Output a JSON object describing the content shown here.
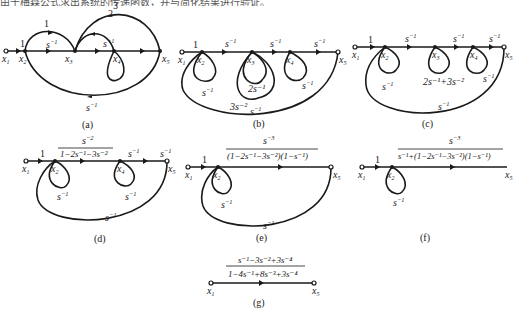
{
  "header_text": "由于梅森公式求出系统的传递函数，并与简化结果进行验证。",
  "diagrams": {
    "a": {
      "caption": "(a)",
      "nodes": [
        "x1",
        "x2",
        "x3",
        "x4",
        "x5"
      ],
      "gains": {
        "x1_x2": "1",
        "x2_x3_upper": "1",
        "x2_x3": "s^-1",
        "x3_x5_outer": "3",
        "x3_x5_inner": "2",
        "x3_x4": "s^-1",
        "x5_x2_feedback": "s^-1"
      }
    },
    "b": {
      "caption": "(b)",
      "gains": {
        "x1_x2": "1",
        "x2_x3": "s^-1",
        "x3_x4": "s^-1",
        "x4_x5": "s^-1",
        "x2_self": "s^-1",
        "x3_self_inner": "2s^-1",
        "x3_self_outer": "3s^-2",
        "x4_self": "s^-1",
        "x5_x2_feedback": "s^-1"
      }
    },
    "c": {
      "caption": "(c)",
      "gains": {
        "x1_x2": "1",
        "x2_x3": "s^-1",
        "x3_x4": "s^-1",
        "x4_x5": "s^-1",
        "x2_self": "s^-1",
        "x3_self": "2s^-1+3s^-2",
        "x4_self": "s^-1",
        "x5_x2_feedback": "s^-1"
      }
    },
    "d": {
      "caption": "(d)",
      "gains": {
        "x1_x2": "1",
        "x2_x4": "s^-2 / (1-2s^-1-3s^-2)",
        "x4_x5": "s^-1",
        "x2_self": "s^-1",
        "x4_self": "s^-1",
        "x5_x2_feedback": "s^-1"
      }
    },
    "e": {
      "caption": "(e)",
      "gains": {
        "x1_x2": "1",
        "x2_x5": "s^-3 / ((1-2s^-1-3s^-2)(1-s^-1))",
        "x2_self": "s^-1",
        "x5_x2_feedback": "s^-1"
      }
    },
    "f": {
      "caption": "(f)",
      "gains": {
        "x1_x2": "1",
        "x2_x5": "s^-3 / (s^-1+(1-2s^-1-3s^-2)(1-s^-1))",
        "x2_self": "s^-1"
      }
    },
    "g": {
      "caption": "(g)",
      "gains": {
        "x1_x5": "(s^-1-3s^-2+3s^-4) / (1-4s^-1+8s^-3+3s^-4)"
      }
    }
  },
  "labels": {
    "one": "1",
    "two": "2",
    "three": "3",
    "s": "s",
    "m1": "−1",
    "m2": "−2",
    "m3": "−3",
    "m4": "−4",
    "x": "x",
    "i1": "1",
    "i2": "2",
    "i3": "3",
    "i4": "4",
    "i5": "5"
  },
  "fractions": {
    "d_num": "s",
    "d_num_exp": "−2",
    "d_den": "1−2s⁻¹−3s⁻²",
    "e_num": "s",
    "e_num_exp": "−3",
    "e_den": "(1−2s⁻¹−3s⁻²)(1−s⁻¹)",
    "f_num": "s",
    "f_num_exp": "−3",
    "f_den": "s⁻¹+(1−2s⁻¹−3s⁻²)(1−s⁻¹)",
    "g_num": "s⁻¹−3s⁻²+3s⁻⁴",
    "g_den": "1−4s⁻¹+8s⁻³+3s⁻⁴",
    "c_self3": "2s⁻¹+3s⁻²",
    "b_self3_inner": "2s⁻¹",
    "b_self3_outer": "3s⁻²"
  }
}
